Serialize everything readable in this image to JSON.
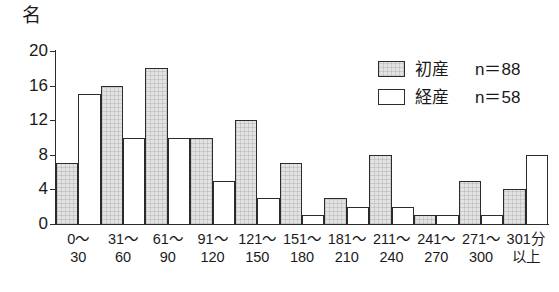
{
  "chart_data": {
    "type": "bar",
    "title": "",
    "xlabel": "",
    "ylabel": "名",
    "ylim": [
      0,
      20
    ],
    "yticks": [
      0,
      4,
      8,
      12,
      16,
      20
    ],
    "grid": false,
    "legend_position": "top-right",
    "categories": [
      "0～30",
      "31～60",
      "61～90",
      "91～120",
      "121～150",
      "151～180",
      "181～210",
      "211～240",
      "241～270",
      "271～300",
      "301分以上"
    ],
    "category_lines": [
      {
        "l1": "0～",
        "l2": "30"
      },
      {
        "l1": "31～",
        "l2": "60"
      },
      {
        "l1": "61～",
        "l2": "90"
      },
      {
        "l1": "91～",
        "l2": "120"
      },
      {
        "l1": "121～",
        "l2": "150"
      },
      {
        "l1": "151～",
        "l2": "180"
      },
      {
        "l1": "181～",
        "l2": "210"
      },
      {
        "l1": "211～",
        "l2": "240"
      },
      {
        "l1": "241～",
        "l2": "270"
      },
      {
        "l1": "271～",
        "l2": "300"
      },
      {
        "l1": "301分",
        "l2": "以上"
      }
    ],
    "series": [
      {
        "name": "初産",
        "n_label": "n＝88",
        "fill": "#e3e3e3",
        "values": [
          7,
          16,
          18,
          10,
          12,
          7,
          3,
          8,
          1,
          5,
          4
        ]
      },
      {
        "name": "経産",
        "n_label": "n＝58",
        "fill": "#ffffff",
        "values": [
          15,
          10,
          10,
          5,
          3,
          1,
          2,
          2,
          1,
          1,
          8
        ]
      }
    ]
  },
  "axis": {
    "unit_label": "名",
    "y_tick_labels": [
      "20",
      "16",
      "12",
      "8",
      "4",
      "0"
    ]
  },
  "legend": {
    "rows": [
      {
        "name": "初産",
        "n": "n＝88"
      },
      {
        "name": "経産",
        "n": "n＝58"
      }
    ]
  },
  "colors": {
    "axis": "#2b2b2b",
    "series1_fill": "#e3e3e3",
    "series2_fill": "#ffffff",
    "text": "#1a1a1a",
    "background": "#ffffff"
  }
}
